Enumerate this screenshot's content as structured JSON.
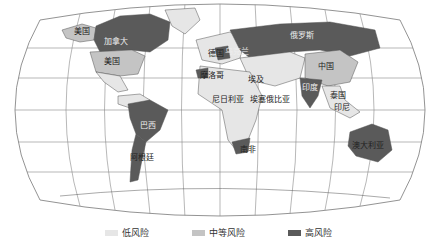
{
  "map": {
    "colors": {
      "low": "#e6e6e6",
      "medium": "#c4c4c4",
      "high": "#5a5a5a",
      "border": "#555555",
      "graticule": "#777777"
    },
    "labels": {
      "alaska": "美国",
      "canada": "加拿大",
      "usa": "美国",
      "russia": "俄罗斯",
      "china": "中国",
      "india": "印度",
      "germany": "德国",
      "ukraine": "乌克兰",
      "morocco": "摩洛哥",
      "egypt": "埃及",
      "nigeria": "尼日利亚",
      "ethiopia": "埃塞俄比亚",
      "brazil": "巴西",
      "argentina": "阿根廷",
      "south_africa": "南非",
      "australia": "澳大利亚",
      "thailand": "泰国",
      "indonesia": "印尼"
    }
  },
  "legend": {
    "low": "低风险",
    "medium": "中等风险",
    "high": "高风险"
  }
}
